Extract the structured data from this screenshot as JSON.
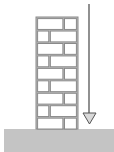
{
  "diagram": {
    "colors": {
      "background": "#ffffff",
      "brick_fill": "#ffffff",
      "mortar": "#8a8a8a",
      "ground_fill": "#c4c4c4",
      "arrow_line": "#555555",
      "arrowhead_fill": "#d9d9d9"
    },
    "wall": {
      "x": 36,
      "y": 17,
      "width": 42,
      "height": 112,
      "rows": 9,
      "pattern": [
        "long-short",
        "short-long",
        "long-short",
        "short-long",
        "long-short",
        "short-long",
        "long-short",
        "short-long",
        "long-short"
      ]
    },
    "ground": {
      "x": 4,
      "y": 129,
      "width": 110,
      "height": 23
    },
    "arrow": {
      "x": 89,
      "y_start": 4,
      "y_end": 124,
      "direction": "down",
      "icon": "down-arrow-icon"
    }
  }
}
